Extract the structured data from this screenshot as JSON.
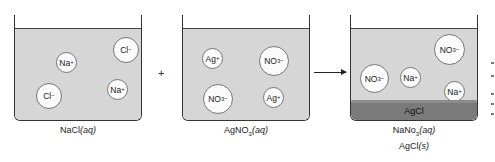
{
  "beakers": [
    {
      "id": "nacl",
      "label": "NaCl(aq)",
      "label_formula": "NaCl",
      "label_state": "(aq)",
      "ions": [
        {
          "symbol": "Cl",
          "charge": "−"
        },
        {
          "symbol": "Na",
          "charge": "+"
        },
        {
          "symbol": "Na",
          "charge": "+"
        },
        {
          "symbol": "Cl",
          "charge": "−"
        }
      ]
    },
    {
      "id": "agno3",
      "label": "AgNO3(aq)",
      "label_formula_a": "AgNO",
      "label_formula_sub": "3",
      "label_state": "(aq)",
      "ions": [
        {
          "symbol": "Ag",
          "charge": "+"
        },
        {
          "symbol": "NO",
          "sub": "3",
          "charge": "−"
        },
        {
          "symbol": "NO",
          "sub": "3",
          "charge": "−"
        },
        {
          "symbol": "Ag",
          "charge": "+"
        }
      ]
    },
    {
      "id": "products",
      "label_line1": "NaNo3(aq)",
      "label_line1_a": "NaNo",
      "label_line1_sub": "3",
      "label_line1_state": "(aq)",
      "label_line2_a": "AgCl",
      "label_line2_state": "(s)",
      "precipitate": "AgCl",
      "ions": [
        {
          "symbol": "NO",
          "sub": "3",
          "charge": "−"
        },
        {
          "symbol": "NO",
          "sub": "3",
          "charge": "−"
        },
        {
          "symbol": "Na",
          "charge": "+"
        },
        {
          "symbol": "Na",
          "charge": "+"
        }
      ]
    }
  ],
  "operators": {
    "plus": "+"
  },
  "colors": {
    "liquid": "#d6d6d6",
    "precipitate": "#7a7a7a",
    "ion_fill": "#fbfbfb",
    "outline": "#333333"
  }
}
